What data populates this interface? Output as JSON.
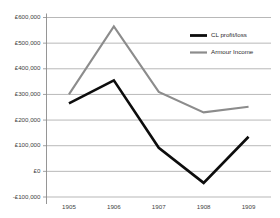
{
  "chart_data": {
    "type": "line",
    "title": "",
    "subtitle": "",
    "xlabel": "",
    "ylabel": "",
    "categories": [
      "1905",
      "1906",
      "1907",
      "1908",
      "1909"
    ],
    "ylim": [
      -100000,
      600000
    ],
    "ytick_values": [
      600000,
      500000,
      400000,
      300000,
      200000,
      100000,
      0,
      -100000
    ],
    "ytick_labels": [
      "£600,000",
      "£500,000",
      "£400,000",
      "£300,000",
      "£200,000",
      "£100,000",
      "£0",
      "-£100,000"
    ],
    "grid": true,
    "grid_axis": "y",
    "legend_position": "top-right",
    "series": [
      {
        "name": "CL profit/loss",
        "color": "#0d0d0d",
        "width": 2.6,
        "values": [
          265000,
          355000,
          92000,
          -45000,
          135000
        ]
      },
      {
        "name": "Armour Income",
        "color": "#8c8c8c",
        "width": 2.1,
        "values": [
          300000,
          565000,
          310000,
          230000,
          252000
        ]
      }
    ]
  },
  "legend": {
    "items": [
      {
        "label": "CL profit/loss",
        "color": "#0d0d0d"
      },
      {
        "label": "Armour Income",
        "color": "#8c8c8c"
      }
    ]
  }
}
